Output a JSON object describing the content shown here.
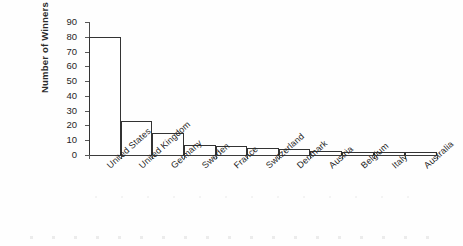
{
  "chart_data": {
    "type": "bar",
    "title": "",
    "subtitle": "",
    "xlabel": "",
    "ylabel": "Number of Winners",
    "categories": [
      "United States",
      "United Kingdom",
      "Germany",
      "Sweden",
      "France",
      "Switzerland",
      "Denmark",
      "Austria",
      "Belgium",
      "Italy",
      "Australia"
    ],
    "values": [
      80,
      23,
      15,
      7,
      6,
      5,
      4,
      3,
      2,
      2,
      2
    ],
    "ylim": [
      0,
      90
    ],
    "ytick_labels": [
      "90",
      "80",
      "70",
      "60",
      "50",
      "40",
      "30",
      "20",
      "10",
      "0"
    ],
    "ytick_values": [
      90,
      80,
      70,
      60,
      50,
      40,
      30,
      20,
      10,
      0
    ],
    "ytick_step": 10,
    "grid": false,
    "legend": null,
    "legend_position": "none",
    "bar_style": {
      "fill": "#ffffff",
      "edge": "#333333",
      "gap": 0,
      "note": "adjacent histogram-style bars"
    },
    "xtick_label_rotation": -42,
    "annotations": []
  }
}
